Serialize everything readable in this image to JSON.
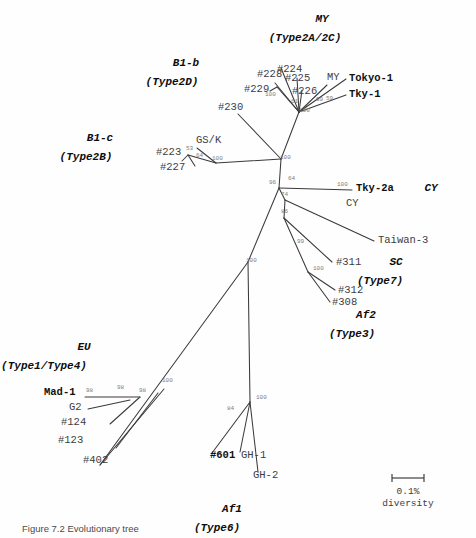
{
  "figure": {
    "type": "unrooted-phylogenetic-tree",
    "background_color": "#fefefe",
    "branch_color": "#3a3a3a",
    "bootstrap_color": "#7d7d7d",
    "label_color": "#3d3d3d",
    "caption_text": "Figure 7.2  Evolutionary tree",
    "scale": {
      "value_label": "0.1%",
      "unit_label": "diversity",
      "x1": 392,
      "x2": 424,
      "y": 478
    }
  },
  "groups": [
    {
      "name": "MY",
      "subtitle": "(Type2A/2C)",
      "x": 322,
      "y": 22,
      "sub_x": 305,
      "sub_y": 41
    },
    {
      "name": "B1-b",
      "subtitle": "(Type2D)",
      "x": 186,
      "y": 66,
      "sub_x": 172,
      "sub_y": 85
    },
    {
      "name": "B1-c",
      "subtitle": "(Type2B)",
      "x": 100,
      "y": 141,
      "sub_x": 86,
      "sub_y": 160
    },
    {
      "name": "CY",
      "subtitle": "",
      "x": 431,
      "y": 191,
      "sub_x": 0,
      "sub_y": 0
    },
    {
      "name": "SC",
      "subtitle": "(Type7)",
      "x": 396,
      "y": 265,
      "sub_x": 380,
      "sub_y": 284
    },
    {
      "name": "Af2",
      "subtitle": "(Type3)",
      "x": 366,
      "y": 318,
      "sub_x": 352,
      "sub_y": 337
    },
    {
      "name": "EU",
      "subtitle": "(Type1/Type4)",
      "x": 84,
      "y": 350,
      "sub_x": 44,
      "sub_y": 369
    },
    {
      "name": "Af1",
      "subtitle": "(Type6)",
      "x": 232,
      "y": 512,
      "sub_x": 217,
      "sub_y": 531
    }
  ],
  "taxa": [
    {
      "label": "#224",
      "x": 277,
      "y": 72,
      "bold": false,
      "anchor": "start"
    },
    {
      "label": "#228",
      "x": 257,
      "y": 77,
      "bold": false,
      "anchor": "start"
    },
    {
      "label": "#229",
      "x": 244,
      "y": 92,
      "bold": false,
      "anchor": "start"
    },
    {
      "label": "#225",
      "x": 285,
      "y": 81,
      "bold": false,
      "anchor": "start"
    },
    {
      "label": "#226",
      "x": 292,
      "y": 94,
      "bold": false,
      "anchor": "start"
    },
    {
      "label": "MY",
      "x": 327,
      "y": 80,
      "bold": false,
      "anchor": "start"
    },
    {
      "label": "Tokyo-1",
      "x": 349,
      "y": 81,
      "bold": true,
      "anchor": "start"
    },
    {
      "label": "Tky-1",
      "x": 349,
      "y": 97,
      "bold": true,
      "anchor": "start"
    },
    {
      "label": "#230",
      "x": 218,
      "y": 110,
      "bold": false,
      "anchor": "start"
    },
    {
      "label": "GS/K",
      "x": 196,
      "y": 143,
      "bold": false,
      "anchor": "start"
    },
    {
      "label": "#223",
      "x": 156,
      "y": 155,
      "bold": false,
      "anchor": "start"
    },
    {
      "label": "#227",
      "x": 160,
      "y": 170,
      "bold": false,
      "anchor": "start"
    },
    {
      "label": "Tky-2a",
      "x": 356,
      "y": 191,
      "bold": true,
      "anchor": "start"
    },
    {
      "label": "CY",
      "x": 346,
      "y": 206,
      "bold": false,
      "anchor": "start"
    },
    {
      "label": "Taiwan-3",
      "x": 378,
      "y": 243,
      "bold": false,
      "anchor": "start"
    },
    {
      "label": "#311",
      "x": 336,
      "y": 265,
      "bold": false,
      "anchor": "start"
    },
    {
      "label": "#312",
      "x": 338,
      "y": 293,
      "bold": false,
      "anchor": "start"
    },
    {
      "label": "#308",
      "x": 332,
      "y": 305,
      "bold": false,
      "anchor": "start"
    },
    {
      "label": "Mad-1",
      "x": 44,
      "y": 395,
      "bold": true,
      "anchor": "start"
    },
    {
      "label": "G2",
      "x": 69,
      "y": 410,
      "bold": false,
      "anchor": "start"
    },
    {
      "label": "#124",
      "x": 61,
      "y": 425,
      "bold": false,
      "anchor": "start"
    },
    {
      "label": "#123",
      "x": 58,
      "y": 443,
      "bold": false,
      "anchor": "start"
    },
    {
      "label": "#402",
      "x": 83,
      "y": 463,
      "bold": false,
      "anchor": "start"
    },
    {
      "label": "#601",
      "x": 210,
      "y": 458,
      "bold": true,
      "anchor": "start"
    },
    {
      "label": "GH-1",
      "x": 241,
      "y": 458,
      "bold": false,
      "anchor": "start"
    },
    {
      "label": "GH-2",
      "x": 253,
      "y": 478,
      "bold": false,
      "anchor": "start"
    }
  ],
  "bootstraps": [
    {
      "value": "100",
      "x": 265,
      "y": 96
    },
    {
      "value": "61",
      "x": 291,
      "y": 103
    },
    {
      "value": "100",
      "x": 299,
      "y": 112
    },
    {
      "value": "99",
      "x": 316,
      "y": 101
    },
    {
      "value": "59",
      "x": 326,
      "y": 100
    },
    {
      "value": "53",
      "x": 186,
      "y": 150
    },
    {
      "value": "64",
      "x": 196,
      "y": 157
    },
    {
      "value": "100",
      "x": 212,
      "y": 160
    },
    {
      "value": "100",
      "x": 280,
      "y": 159
    },
    {
      "value": "96",
      "x": 269,
      "y": 184
    },
    {
      "value": "64",
      "x": 288,
      "y": 180
    },
    {
      "value": "74",
      "x": 281,
      "y": 196
    },
    {
      "value": "100",
      "x": 337,
      "y": 186
    },
    {
      "value": "86",
      "x": 281,
      "y": 213
    },
    {
      "value": "99",
      "x": 297,
      "y": 243
    },
    {
      "value": "100",
      "x": 313,
      "y": 270
    },
    {
      "value": "100",
      "x": 246,
      "y": 262
    },
    {
      "value": "100",
      "x": 162,
      "y": 382
    },
    {
      "value": "98",
      "x": 86,
      "y": 392
    },
    {
      "value": "98",
      "x": 117,
      "y": 389
    },
    {
      "value": "98",
      "x": 139,
      "y": 392
    },
    {
      "value": "100",
      "x": 256,
      "y": 399
    },
    {
      "value": "84",
      "x": 227,
      "y": 410
    }
  ],
  "branches": [
    {
      "name": "my-core-to-224",
      "path": "M 299,112 L 281,68"
    },
    {
      "name": "my-core-to-228",
      "path": "M 299,112 L 275,83"
    },
    {
      "name": "my-core-to-229",
      "path": "M 299,112 L 277,87"
    },
    {
      "name": "my-228-229-node",
      "path": "M 277,87 L 270,91"
    },
    {
      "name": "my-core-to-225",
      "path": "M 299,112 L 297,78"
    },
    {
      "name": "my-core-to-226",
      "path": "M 299,112 L 302,90"
    },
    {
      "name": "my-core-to-tokyo",
      "path": "M 299,112 L 346,79"
    },
    {
      "name": "my-core-to-tky1",
      "path": "M 299,112 L 346,95"
    },
    {
      "name": "my-core-to-my",
      "path": "M 299,112 L 327,85"
    },
    {
      "name": "my-stem",
      "path": "M 299,112 L 281,159"
    },
    {
      "name": "b1b-230",
      "path": "M 281,159 L 238,114"
    },
    {
      "name": "b1c-stem",
      "path": "M 281,159 L 216,163"
    },
    {
      "name": "b1c-node-gsk",
      "path": "M 216,163 L 197,148"
    },
    {
      "name": "b1c-node-223",
      "path": "M 216,163 L 188,155"
    },
    {
      "name": "b1c-223-227",
      "path": "M 188,155 L 182,161"
    },
    {
      "name": "b1c-node-227",
      "path": "M 188,155 L 195,166"
    },
    {
      "name": "center-a-b",
      "path": "M 281,159 L 279,188"
    },
    {
      "name": "cy-branch",
      "path": "M 279,188 L 352,190"
    },
    {
      "name": "center-b-c",
      "path": "M 279,188 L 285,200"
    },
    {
      "name": "taiwan3-branch",
      "path": "M 285,200 L 374,241"
    },
    {
      "name": "center-c-d",
      "path": "M 285,200 L 284,218"
    },
    {
      "name": "sc-node-311",
      "path": "M 284,218 L 332,262"
    },
    {
      "name": "sc-node-stem",
      "path": "M 284,218 L 308,272"
    },
    {
      "name": "sc-node-312",
      "path": "M 308,272 L 335,290"
    },
    {
      "name": "sc-node-308",
      "path": "M 308,272 L 330,302"
    },
    {
      "name": "trunk-upper",
      "path": "M 279,188 L 248,262"
    },
    {
      "name": "trunk-eu",
      "path": "M 248,262 L 100,465"
    },
    {
      "name": "trunk-af1",
      "path": "M 248,262 L 250,402"
    },
    {
      "name": "eu-node-main",
      "path": "M 164,389 L 100,465"
    },
    {
      "name": "eu-node-123",
      "path": "M 158,393 L 116,448"
    },
    {
      "name": "eu-node-124",
      "path": "M 140,397 L 110,424"
    },
    {
      "name": "eu-node-mad",
      "path": "M 140,397 L 85,397"
    },
    {
      "name": "eu-node-g2",
      "path": "M 130,400 L 88,409"
    },
    {
      "name": "af1-node-601",
      "path": "M 250,402 L 212,453"
    },
    {
      "name": "af1-node-gh1",
      "path": "M 250,402 L 240,452"
    },
    {
      "name": "af1-node-gh2",
      "path": "M 250,402 L 258,472"
    }
  ]
}
